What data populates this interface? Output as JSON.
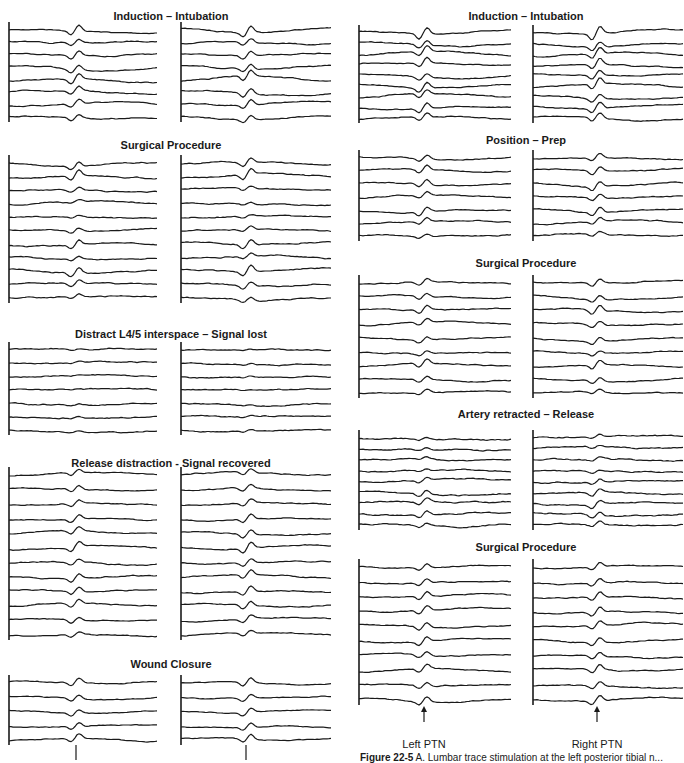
{
  "chart_data": {
    "type": "line",
    "columns": [
      {
        "name": "left-figure",
        "panels": [
          {
            "title": "Induction – Intubation",
            "title_x": 171,
            "title_y": 10,
            "top": 30,
            "bottom": 117,
            "traces": 8,
            "peak_strength": [
              0.6,
              0.4,
              0.5,
              0.5,
              0.6,
              0.5,
              0.5,
              0.4
            ],
            "noise": 0.8
          },
          {
            "title": "Surgical Procedure",
            "title_x": 171,
            "title_y": 139,
            "top": 163,
            "bottom": 298,
            "traces": 11,
            "peak_strength": [
              0.5,
              0.6,
              0.3,
              0.2,
              0.2,
              0.3,
              0.5,
              0.3,
              0.6,
              0.4,
              0.3
            ],
            "noise": 0.9
          },
          {
            "title": "Distract L4/5 interspace – Signal lost",
            "title_x": 171,
            "title_y": 328,
            "top": 350,
            "bottom": 430,
            "traces": 7,
            "peak_strength": [
              0.1,
              0.1,
              0.1,
              0.1,
              0.1,
              0.1,
              0.1
            ],
            "noise": 0.9
          },
          {
            "title": "Release distraction - Signal recovered",
            "title_x": 171,
            "title_y": 457,
            "top": 475,
            "bottom": 635,
            "traces": 12,
            "peak_strength": [
              0.4,
              0.4,
              0.4,
              0.5,
              0.5,
              0.6,
              0.4,
              0.5,
              0.5,
              0.5,
              0.4,
              0.3
            ],
            "noise": 0.8
          },
          {
            "title": "Wound Closure",
            "title_x": 171,
            "title_y": 658,
            "top": 683,
            "bottom": 740,
            "traces": 5,
            "peak_strength": [
              0.5,
              0.4,
              0.4,
              0.4,
              0.5
            ],
            "noise": 0.7
          }
        ],
        "left_trace_x": [
          9,
          158
        ],
        "right_trace_x": [
          181,
          332
        ],
        "left_peak_x": 76,
        "right_peak_x": 248
      },
      {
        "name": "right-figure",
        "panels": [
          {
            "title": "Induction – Intubation",
            "title_x": 526,
            "title_y": 10,
            "top": 33,
            "bottom": 118,
            "traces": 9,
            "peak_strength": [
              0.7,
              0.5,
              0.6,
              0.6,
              0.5,
              0.6,
              0.5,
              0.6,
              0.5
            ],
            "noise": 0.8
          },
          {
            "title": "Position – Prep",
            "title_x": 526,
            "title_y": 134,
            "top": 158,
            "bottom": 236,
            "traces": 7,
            "peak_strength": [
              0.4,
              0.5,
              0.5,
              0.4,
              0.5,
              0.4,
              0.3
            ],
            "noise": 0.8
          },
          {
            "title": "Surgical Procedure",
            "title_x": 526,
            "title_y": 257,
            "top": 283,
            "bottom": 393,
            "traces": 9,
            "peak_strength": [
              0.4,
              0.4,
              0.5,
              0.4,
              0.4,
              0.3,
              0.5,
              0.4,
              0.3
            ],
            "noise": 0.8
          },
          {
            "title": "Artery retracted – Release",
            "title_x": 526,
            "title_y": 408,
            "top": 438,
            "bottom": 525,
            "traces": 9,
            "peak_strength": [
              0.2,
              0.2,
              0.2,
              0.2,
              0.3,
              0.4,
              0.4,
              0.4,
              0.3
            ],
            "noise": 1.0
          },
          {
            "title": "Surgical Procedure",
            "title_x": 526,
            "title_y": 541,
            "top": 567,
            "bottom": 700,
            "traces": 10,
            "peak_strength": [
              0.4,
              0.4,
              0.5,
              0.5,
              0.5,
              0.5,
              0.4,
              0.5,
              0.4,
              0.5
            ],
            "noise": 0.8
          }
        ],
        "left_trace_x": [
          359,
          512
        ],
        "right_trace_x": [
          533,
          684
        ],
        "left_peak_x": 424,
        "right_peak_x": 597
      }
    ],
    "annotations": [
      {
        "type": "arrow",
        "x": 424,
        "y1": 722,
        "y2": 706,
        "label": "Left PTN",
        "label_y": 740
      },
      {
        "type": "arrow",
        "x": 597,
        "y1": 722,
        "y2": 706,
        "label": "Right PTN",
        "label_y": 740
      },
      {
        "type": "tick",
        "x": 76,
        "y1": 745,
        "y2": 760
      },
      {
        "type": "tick",
        "x": 246,
        "y1": 745,
        "y2": 760
      }
    ]
  },
  "labels": {
    "left_ptn": "Left PTN",
    "right_ptn": "Right PTN"
  },
  "caption": {
    "figure_number": "Figure 22-5",
    "text": " A. Lumbar trace stimulation at the left posterior tibial n..."
  },
  "colors": {
    "trace": "#1a1a1a",
    "background": "#ffffff"
  }
}
